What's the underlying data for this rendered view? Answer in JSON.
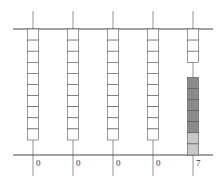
{
  "diagram": {
    "type": "abacus-place-value",
    "columns": [
      {
        "x": 33,
        "value": "0",
        "upper_white": 10,
        "lower_beads": []
      },
      {
        "x": 73,
        "value": "0",
        "upper_white": 10,
        "lower_beads": []
      },
      {
        "x": 113,
        "value": "0",
        "upper_white": 10,
        "lower_beads": []
      },
      {
        "x": 153,
        "value": "0",
        "upper_white": 10,
        "lower_beads": []
      },
      {
        "x": 193,
        "value": "7",
        "upper_white": 3,
        "lower_beads": [
          "dark",
          "dark",
          "dark",
          "dark",
          "dark",
          "light",
          "light"
        ]
      }
    ],
    "colors": {
      "dark": "#8a8a8a",
      "light": "#c8c8c8",
      "line": "#444444",
      "box_border": "#555555"
    }
  }
}
